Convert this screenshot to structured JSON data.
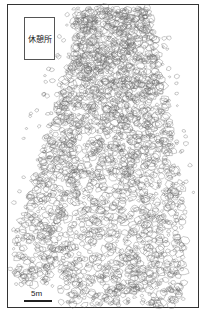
{
  "map": {
    "label": "休憩所",
    "scale_label": "5m",
    "colors": {
      "frame": "#333333",
      "stone_outline": "#666666",
      "background": "#ffffff"
    }
  }
}
